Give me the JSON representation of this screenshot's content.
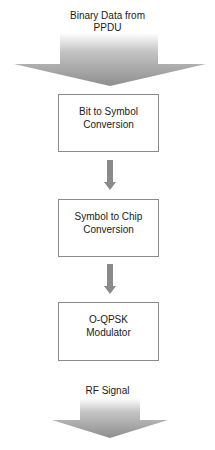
{
  "diagram": {
    "type": "flowchart",
    "direction": "top-to-bottom",
    "input": {
      "label_line1": "Binary Data from",
      "label_line2": "PPDU"
    },
    "steps": [
      {
        "line1": "Bit to Symbol",
        "line2": "Conversion"
      },
      {
        "line1": "Symbol to Chip",
        "line2": "Conversion"
      },
      {
        "line1": "O-QPSK",
        "line2": "Modulator"
      }
    ],
    "output": {
      "label": "RF Signal"
    },
    "colors": {
      "arrow": "#8c8c8c",
      "box_border": "#8a8a8a",
      "text": "#1a1a1a"
    }
  }
}
